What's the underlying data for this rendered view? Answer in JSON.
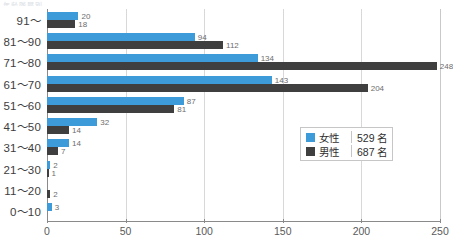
{
  "title_remnant": "年齢階層別",
  "chart_data": {
    "type": "bar",
    "orientation": "horizontal",
    "title": "",
    "xlabel": "",
    "ylabel": "",
    "xlim": [
      0,
      250
    ],
    "xticks": [
      0,
      50,
      100,
      150,
      200,
      250
    ],
    "xtick_labels": [
      "0",
      "50",
      "100",
      "150",
      "200",
      "250"
    ],
    "grid": true,
    "grid_axis": "x",
    "legend_position": "center-right",
    "categories": [
      "91～",
      "81～90",
      "71～80",
      "61～70",
      "51～60",
      "41～50",
      "31～40",
      "21～30",
      "11～20",
      "0～10"
    ],
    "series": [
      {
        "name": "女性",
        "color": "#3d9bd9",
        "total": 529,
        "total_label": "529 名",
        "values": [
          20,
          94,
          134,
          143,
          87,
          32,
          14,
          2,
          0,
          3
        ],
        "value_labels": [
          "20",
          "94",
          "134",
          "143",
          "87",
          "32",
          "14",
          "2",
          "",
          "3"
        ]
      },
      {
        "name": "男性",
        "color": "#3f3f3f",
        "total": 687,
        "total_label": "687 名",
        "values": [
          18,
          112,
          248,
          204,
          81,
          14,
          7,
          1,
          2,
          0
        ],
        "value_labels": [
          "18",
          "112",
          "248",
          "204",
          "81",
          "14",
          "7",
          "1",
          "2",
          ""
        ]
      }
    ]
  },
  "legend": {
    "rows": [
      {
        "name": "女性",
        "count": "529 名",
        "color": "#3d9bd9"
      },
      {
        "name": "男性",
        "count": "687 名",
        "color": "#3f3f3f"
      }
    ]
  }
}
